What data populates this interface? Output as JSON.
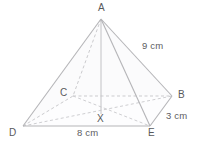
{
  "diagram": {
    "type": "geometry-figure",
    "shape": "rectangular-pyramid",
    "stroke_color": "#b9b9bb",
    "dashed_color": "#c9c9cb",
    "text_color": "#59595b",
    "background": "#ffffff",
    "vertices": [
      {
        "id": "A",
        "label": "A",
        "role": "apex",
        "x": 101,
        "y": 19,
        "label_x": 101,
        "label_y": 9,
        "hidden": false
      },
      {
        "id": "B",
        "label": "B",
        "role": "base-back-right",
        "x": 172,
        "y": 96,
        "label_x": 182,
        "label_y": 96,
        "hidden": false
      },
      {
        "id": "C",
        "label": "C",
        "role": "base-back-left",
        "x": 73,
        "y": 96,
        "label_x": 64,
        "label_y": 94,
        "hidden": true
      },
      {
        "id": "D",
        "label": "D",
        "role": "base-front-left",
        "x": 23,
        "y": 126,
        "label_x": 13,
        "label_y": 133,
        "hidden": false
      },
      {
        "id": "E",
        "label": "E",
        "role": "base-front-right",
        "x": 150,
        "y": 126,
        "label_x": 152,
        "label_y": 133,
        "hidden": false
      },
      {
        "id": "X",
        "label": "X",
        "role": "base-centre",
        "x": 101,
        "y": 112,
        "label_x": 101,
        "label_y": 120,
        "hidden": true
      }
    ],
    "measurements": [
      {
        "id": "slant-AB",
        "label": "9 cm",
        "edge": "A-B",
        "x": 155,
        "y": 47
      },
      {
        "id": "side-BE",
        "label": "3 cm",
        "edge": "B-E",
        "x": 177,
        "y": 116
      },
      {
        "id": "base-DE",
        "label": "8 cm",
        "edge": "D-E",
        "x": 90,
        "y": 133
      }
    ],
    "edges": [
      {
        "id": "A-D",
        "from": "A",
        "to": "D",
        "style": "solid"
      },
      {
        "id": "A-E",
        "from": "A",
        "to": "E",
        "style": "solid"
      },
      {
        "id": "A-B",
        "from": "A",
        "to": "B",
        "style": "solid"
      },
      {
        "id": "A-C",
        "from": "A",
        "to": "C",
        "style": "dashed"
      },
      {
        "id": "A-X",
        "from": "A",
        "to": "X",
        "style": "solid-faint",
        "note": "vertical height"
      },
      {
        "id": "D-E",
        "from": "D",
        "to": "E",
        "style": "solid"
      },
      {
        "id": "E-B",
        "from": "E",
        "to": "B",
        "style": "solid"
      },
      {
        "id": "D-C",
        "from": "D",
        "to": "C",
        "style": "dashed"
      },
      {
        "id": "C-B",
        "from": "C",
        "to": "B",
        "style": "dashed"
      },
      {
        "id": "D-B",
        "from": "D",
        "to": "B",
        "style": "dashed",
        "note": "base diagonal"
      },
      {
        "id": "C-E",
        "from": "C",
        "to": "E",
        "style": "dashed",
        "note": "base diagonal"
      }
    ]
  }
}
